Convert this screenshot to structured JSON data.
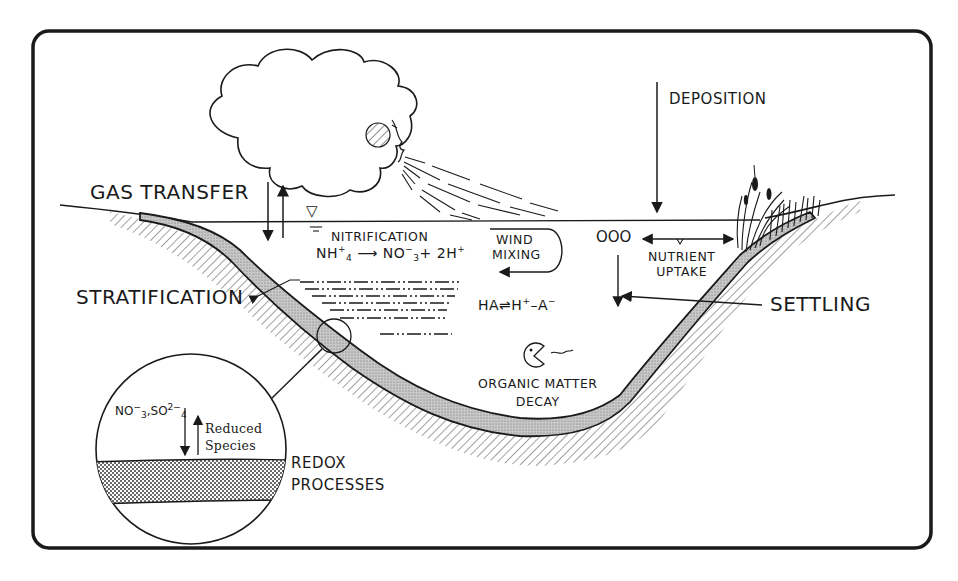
{
  "diagram": {
    "labels": {
      "gas_transfer": "GAS TRANSFER",
      "deposition": "DEPOSITION",
      "nitrification": "NITRIFICATION",
      "nitrification_eq_left": "NH",
      "nitrification_eq_left_sub": "4",
      "nitrification_eq_left_sup": "+",
      "nitrification_eq_arrow": "⟶",
      "nitrification_eq_mid": "NO",
      "nitrification_eq_mid_sub": "3",
      "nitrification_eq_mid_sup": "−",
      "nitrification_eq_right": "+ 2H",
      "nitrification_eq_right_sup": "+",
      "wind_mixing_line1": "WIND",
      "wind_mixing_line2": "MIXING",
      "nutrient_uptake_line1": "NUTRIENT",
      "nutrient_uptake_line2": "UPTAKE",
      "stratification": "STRATIFICATION",
      "acid_eq_left": "HA",
      "acid_eq_arrow": "⇌",
      "acid_eq_right": "H",
      "acid_eq_right_sup": "+",
      "acid_eq_tail": "–A",
      "acid_eq_tail_sup": "−",
      "settling": "SETTLING",
      "organic_line1": "ORGANIC MATTER",
      "organic_line2": "DECAY",
      "redox_line1": "REDOX",
      "redox_line2": "PROCESSES",
      "inset_species_1": "NO",
      "inset_species_1_sub": "3",
      "inset_species_1_sup": "−",
      "inset_sep": ",",
      "inset_species_2": "SO",
      "inset_species_2_sub": "4",
      "inset_species_2_sup": "2−",
      "reduced_line1": "Reduced",
      "reduced_line2": "Species",
      "bubbles": "OOO",
      "water_level_symbol": "▽"
    },
    "colors": {
      "ink": "#1a1a1a",
      "background": "#ffffff",
      "sediment_fill": "#bdbdbd"
    }
  }
}
